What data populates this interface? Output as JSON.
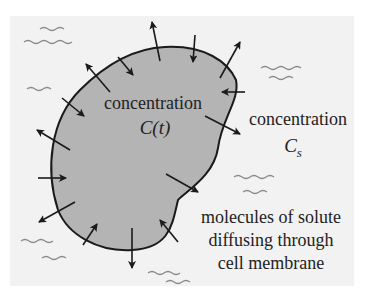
{
  "diagram": {
    "cell_label": {
      "line1": "concentration",
      "line2": "C(t)"
    },
    "outside_label": {
      "line1": "concentration",
      "line2_main": "C",
      "line2_sub": "s"
    },
    "caption": {
      "line1": "molecules of solute",
      "line2": "diffusing through",
      "line3": "cell membrane"
    },
    "colors": {
      "panel": "#f2f2f2",
      "cell_fill": "#b4b4b4",
      "outline": "#1a1a1a",
      "wave": "#8a8a8a"
    }
  }
}
